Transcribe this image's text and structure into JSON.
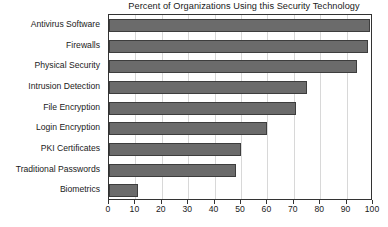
{
  "chart_data": {
    "type": "bar",
    "orientation": "horizontal",
    "title": "Percent of Organizations Using this Security Technology",
    "xlabel": "",
    "ylabel": "",
    "xlim": [
      0,
      100
    ],
    "xticks": [
      0,
      10,
      20,
      30,
      40,
      50,
      60,
      70,
      80,
      90,
      100
    ],
    "xtick_labels": [
      "0",
      "10",
      "20",
      "30",
      "40",
      "50",
      "60",
      "70",
      "80",
      "90",
      "100"
    ],
    "grid": true,
    "grid_axis": "x",
    "legend": false,
    "bar_color": "#6b6b6b",
    "bar_edge_color": "#3d3d3d",
    "categories": [
      "Antivirus Software",
      "Firewalls",
      "Physical Security",
      "Intrusion Detection",
      "File Encryption",
      "Login Encryption",
      "PKI Certificates",
      "Traditional Passwords",
      "Biometrics"
    ],
    "values": [
      99,
      98,
      94,
      75,
      71,
      60,
      50,
      48,
      11
    ]
  }
}
